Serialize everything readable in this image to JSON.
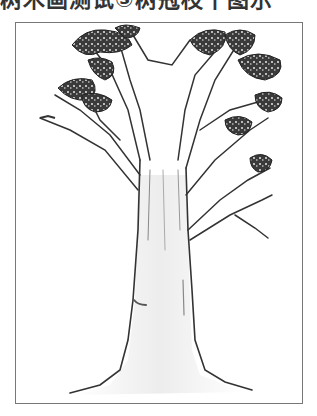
{
  "caption": {
    "text": "树木画测试③树冠枝干图示"
  },
  "drawing": {
    "subject": "tree-sketch",
    "description": "Pencil sketch of a tree with tall trunk, flared roots and open branches with scribbled leaf clusters",
    "frame_color": "#777777",
    "stroke_color": "#333333",
    "leaf_color": "#2a2a2a"
  }
}
